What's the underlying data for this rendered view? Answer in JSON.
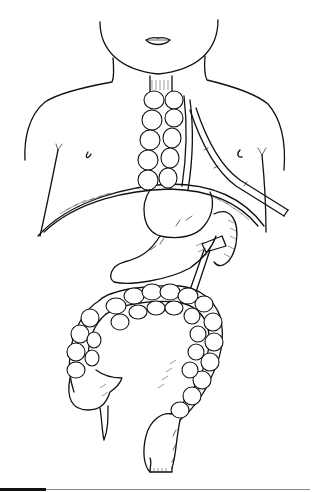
{
  "figure": {
    "subject": "Medical line illustration: child torso showing colon interposition replacing esophagus, with stomach, colon loops, and a drainage tube",
    "style": "black ink line drawing with hatching on white background",
    "colors": {
      "ink": "#111111",
      "background": "#ffffff",
      "rule": "#888888"
    },
    "elements": [
      "face-outline",
      "mouth",
      "neck",
      "shoulders-and-torso-outline",
      "nipples",
      "interposed-colon-segment",
      "drainage-tube",
      "diaphragm",
      "stomach",
      "colon-loop",
      "cecum-and-appendix",
      "rectum"
    ]
  },
  "footer": {
    "rule": true,
    "accent_bar": true
  }
}
